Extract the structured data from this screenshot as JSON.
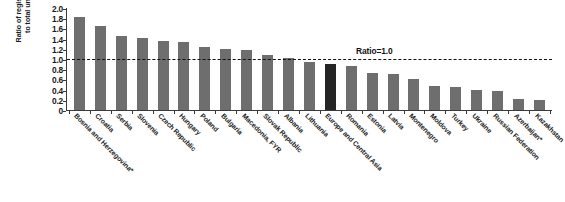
{
  "chart_data": {
    "type": "bar",
    "title": "",
    "xlabel": "",
    "ylabel": "Ratio of registered unemployed to total unemployed, 2009",
    "ylim": [
      0,
      2.0
    ],
    "grid": false,
    "legend_position": "none",
    "categories": [
      "Bosnia and Herzegovina*",
      "Croatia",
      "Serbia",
      "Slovenia",
      "Czech Republic",
      "Hungary",
      "Poland",
      "Bulgaria",
      "Macedonia, FYR",
      "Slovak Republic",
      "Albania",
      "Lithuania",
      "Europe and Central Asia",
      "Romania",
      "Estonia",
      "Latvia",
      "Montenegro",
      "Moldova",
      "Turkey",
      "Ukraine",
      "Russian Federation",
      "Azerbaijan*",
      "Kazakhstan"
    ],
    "values": [
      1.82,
      1.64,
      1.45,
      1.42,
      1.35,
      1.34,
      1.24,
      1.19,
      1.18,
      1.08,
      1.02,
      0.94,
      0.91,
      0.87,
      0.73,
      0.7,
      0.6,
      0.48,
      0.46,
      0.39,
      0.38,
      0.21,
      0.19
    ],
    "highlight_index": 12,
    "bar_color": "#6e6e6e",
    "highlight_color": "#252525",
    "ytick_labels": [
      "2.0",
      "1.8",
      "1.6",
      "1.4",
      "1.2",
      "1.0",
      "0.8",
      "0.6",
      "0.4",
      "0.2",
      "0"
    ],
    "ytick_values": [
      2.0,
      1.8,
      1.6,
      1.4,
      1.2,
      1.0,
      0.8,
      0.6,
      0.4,
      0.2,
      0
    ],
    "annotations": [
      {
        "name": "ratio-reference-line",
        "label": "Ratio=1.0",
        "value": 1.0,
        "style": "dashed"
      }
    ]
  }
}
